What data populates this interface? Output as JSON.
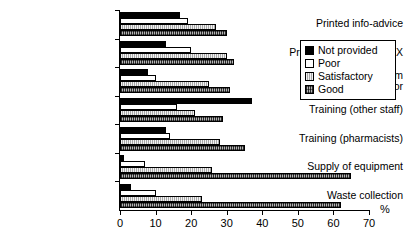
{
  "chart_data": {
    "type": "bar",
    "orientation": "horizontal",
    "title": "",
    "xlabel": "%",
    "ylabel": "",
    "xlim": [
      0,
      70
    ],
    "xticks": [
      0,
      10,
      20,
      30,
      40,
      50,
      60,
      70
    ],
    "grid": false,
    "legend_position": "right-upper",
    "categories": [
      "Printed info-advice",
      "Printed info about PBNX",
      "Support from coordinator",
      "Training (other staff)",
      "Training (pharmacists)",
      "Supply of equipment",
      "Waste collection"
    ],
    "series": [
      {
        "name": "Not provided",
        "color": "#000000",
        "values": [
          17,
          13,
          8,
          37,
          13,
          1,
          3
        ]
      },
      {
        "name": "Poor",
        "color": "#ffffff",
        "values": [
          19,
          20,
          10,
          16,
          14,
          7,
          10
        ]
      },
      {
        "name": "Satisfactory",
        "color": "#a8a8a8",
        "values": [
          27,
          30,
          25,
          21,
          28,
          26,
          23
        ]
      },
      {
        "name": "Good",
        "color": "#b5b5b5",
        "values": [
          30,
          32,
          31,
          29,
          35,
          65,
          62
        ]
      }
    ]
  },
  "axis": {
    "unit_label": "%",
    "tick_labels": [
      "0",
      "10",
      "20",
      "30",
      "40",
      "50",
      "60",
      "70"
    ]
  },
  "legend": {
    "items": [
      {
        "label": "Not provided"
      },
      {
        "label": "Poor"
      },
      {
        "label": "Satisfactory"
      },
      {
        "label": "Good"
      }
    ]
  }
}
